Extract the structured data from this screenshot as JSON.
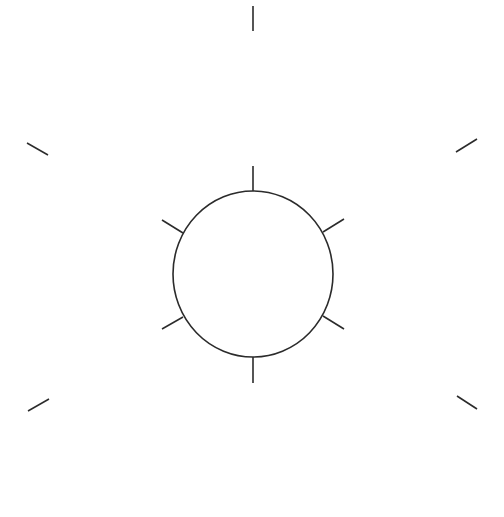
{
  "figure": {
    "description": "Circle with six short radial tick marks, surrounded by six outer radial tick marks",
    "stroke_color": "#2b2b2b",
    "background_color": "#ffffff",
    "circle": {
      "cx": 253,
      "cy": 274,
      "rx": 80,
      "ry": 83
    },
    "inner_ticks": [
      {
        "name": "top",
        "x1": 253,
        "y1": 166,
        "x2": 253,
        "y2": 191
      },
      {
        "name": "upper-right",
        "x1": 323,
        "y1": 232,
        "x2": 344,
        "y2": 219
      },
      {
        "name": "lower-right",
        "x1": 323,
        "y1": 316,
        "x2": 344,
        "y2": 329
      },
      {
        "name": "bottom",
        "x1": 253,
        "y1": 357,
        "x2": 253,
        "y2": 383
      },
      {
        "name": "lower-left",
        "x1": 183,
        "y1": 317,
        "x2": 162,
        "y2": 329
      },
      {
        "name": "upper-left",
        "x1": 183,
        "y1": 233,
        "x2": 162,
        "y2": 220
      }
    ],
    "outer_ticks": [
      {
        "name": "top",
        "x1": 253,
        "y1": 6,
        "x2": 253,
        "y2": 31
      },
      {
        "name": "upper-right",
        "x1": 456,
        "y1": 152,
        "x2": 477,
        "y2": 139
      },
      {
        "name": "lower-right",
        "x1": 457,
        "y1": 396,
        "x2": 477,
        "y2": 409
      },
      {
        "name": "lower-left",
        "x1": 49,
        "y1": 399,
        "x2": 28,
        "y2": 411
      },
      {
        "name": "upper-left",
        "x1": 48,
        "y1": 155,
        "x2": 27,
        "y2": 143
      }
    ]
  }
}
